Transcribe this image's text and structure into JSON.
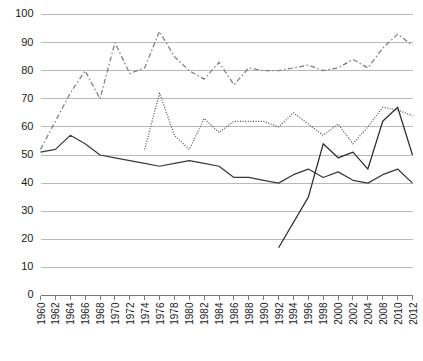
{
  "chart_data": {
    "type": "line",
    "title": "",
    "subtitle": "",
    "xlabel": "",
    "ylabel": "",
    "xlim": [
      1960,
      2012
    ],
    "ylim": [
      0,
      100
    ],
    "grid": true,
    "legend_position": "bottom",
    "x_tick_labels": [
      "1960",
      "1962",
      "1964",
      "1966",
      "1968",
      "1970",
      "1972",
      "1974",
      "1976",
      "1978",
      "1980",
      "1982",
      "1984",
      "1986",
      "1988",
      "1990",
      "1992",
      "1994",
      "1996",
      "1998",
      "2000",
      "2002",
      "2004",
      "2008",
      "2010",
      "2012"
    ],
    "y_tick_labels": [
      "0",
      "10",
      "20",
      "30",
      "40",
      "50",
      "60",
      "70",
      "80",
      "90",
      "100"
    ],
    "y_ticks": [
      0,
      10,
      20,
      30,
      40,
      50,
      60,
      70,
      80,
      90,
      100
    ],
    "series": [
      {
        "name": "White",
        "style": "solid",
        "color": "#3a3a3a",
        "x": [
          1960,
          1962,
          1964,
          1966,
          1968,
          1970,
          1972,
          1974,
          1976,
          1978,
          1980,
          1982,
          1984,
          1986,
          1988,
          1990,
          1992,
          1994,
          1996,
          1998,
          2000,
          2002,
          2004,
          2008,
          2010,
          2012
        ],
        "values": [
          51,
          52,
          57,
          54,
          50,
          49,
          48,
          47,
          46,
          47,
          48,
          47,
          46,
          42,
          42,
          41,
          40,
          43,
          45,
          42,
          44,
          41,
          40,
          43,
          45,
          40
        ]
      },
      {
        "name": "Black",
        "style": "dash-dot",
        "color": "#7d7d7d",
        "x": [
          1960,
          1962,
          1964,
          1966,
          1968,
          1970,
          1972,
          1974,
          1976,
          1978,
          1980,
          1982,
          1984,
          1986,
          1988,
          1990,
          1992,
          1994,
          1996,
          1998,
          2000,
          2002,
          2004,
          2008,
          2010,
          2012
        ],
        "values": [
          52,
          62,
          72,
          80,
          70,
          90,
          79,
          81,
          94,
          85,
          80,
          77,
          83,
          75,
          81,
          80,
          80,
          81,
          82,
          80,
          81,
          84,
          81,
          88,
          93,
          89
        ]
      },
      {
        "name": "Latino",
        "style": "dotted",
        "color": "#4a4a4a",
        "x": [
          1974,
          1976,
          1978,
          1980,
          1982,
          1984,
          1986,
          1988,
          1990,
          1992,
          1994,
          1996,
          1998,
          2000,
          2002,
          2004,
          2008,
          2010,
          2012
        ],
        "values": [
          52,
          72,
          57,
          52,
          63,
          58,
          62,
          62,
          62,
          60,
          65,
          61,
          57,
          61,
          54,
          60,
          67,
          66,
          64
        ]
      },
      {
        "name": "Asian American",
        "style": "solid",
        "color": "#2c2c2c",
        "x": [
          1992,
          1996,
          1998,
          2000,
          2002,
          2004,
          2008,
          2010,
          2012
        ],
        "values": [
          17,
          35,
          54,
          49,
          51,
          45,
          62,
          67,
          50
        ]
      }
    ]
  },
  "legend": {
    "items": [
      {
        "label": "White",
        "style": "solid"
      },
      {
        "label": "Black",
        "style": "dash-dot"
      },
      {
        "label": "Latino",
        "style": "dotted"
      },
      {
        "label": "Asian American",
        "style": "solid"
      }
    ]
  }
}
